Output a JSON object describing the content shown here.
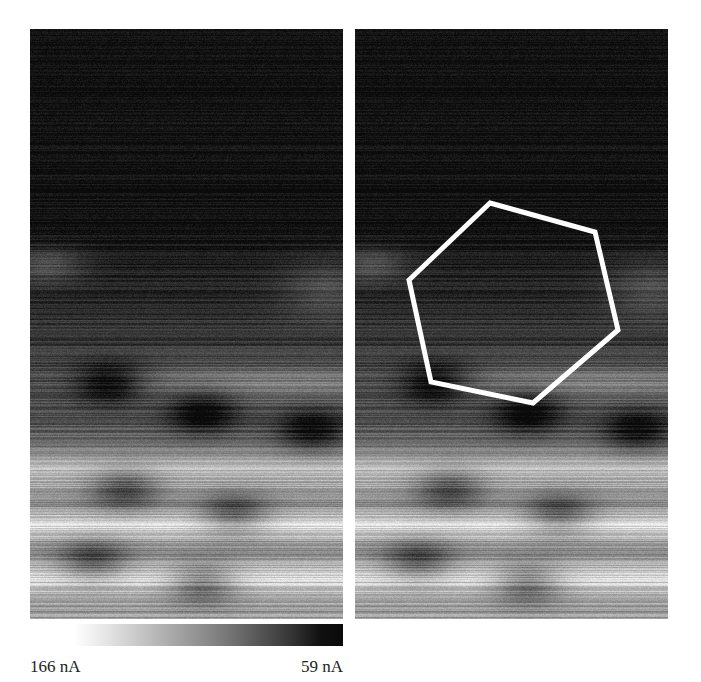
{
  "figure": {
    "panels": [
      {
        "id": "left",
        "description": "STM current image (grayscale)",
        "overlay": null
      },
      {
        "id": "right",
        "description": "Same STM current image with hexagon overlay",
        "overlay": "hexagon"
      }
    ],
    "overlay_color": "#ffffff",
    "colorbar": {
      "min_label": "166 nA",
      "max_label": "59 nA",
      "gradient": "white-to-black"
    }
  }
}
